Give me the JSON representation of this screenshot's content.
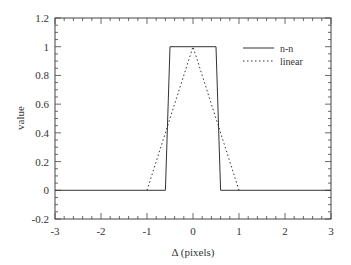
{
  "chart_data": {
    "type": "line",
    "title": "",
    "xlabel": "Δ (pixels)",
    "ylabel": "value",
    "xlim": [
      -3,
      3
    ],
    "ylim": [
      -0.2,
      1.2
    ],
    "xticks": [
      -3,
      -2,
      -1,
      0,
      1,
      2,
      3
    ],
    "xtick_labels": [
      "-3",
      "-2",
      "-1",
      "0",
      "1",
      "2",
      "3"
    ],
    "yticks": [
      -0.2,
      0,
      0.2,
      0.4,
      0.6,
      0.8,
      1,
      1.2
    ],
    "ytick_labels": [
      "-0.2",
      "0",
      "0.2",
      "0.4",
      "0.6",
      "0.8",
      "1",
      "1.2"
    ],
    "grid": false,
    "legend_position": "upper right",
    "series": [
      {
        "name": "n-n",
        "style": "solid",
        "x": [
          -3,
          -0.6,
          -0.5,
          0.5,
          0.6,
          3
        ],
        "y": [
          0,
          0,
          1,
          1,
          0,
          0
        ]
      },
      {
        "name": "linear",
        "style": "dotted",
        "x": [
          -1,
          0,
          1
        ],
        "y": [
          0,
          1,
          0
        ]
      }
    ]
  },
  "legend": {
    "items": [
      {
        "label": "n-n",
        "style": "solid"
      },
      {
        "label": "linear",
        "style": "dotted"
      }
    ]
  },
  "colors": {
    "line": "#333333",
    "axis": "#444444"
  }
}
